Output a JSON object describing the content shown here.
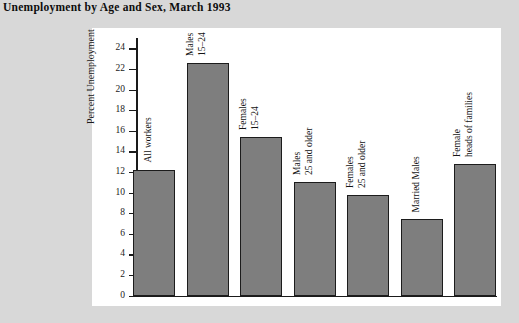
{
  "figure": {
    "title": "Unemployment by Age and Sex, March 1993",
    "panel_background": "#ffffff",
    "page_background": "#d8d8d8"
  },
  "chart_data": {
    "type": "bar",
    "title": "Unemployment by Age and Sex, March 1993",
    "xlabel": "",
    "ylabel": "Percent Unemployment",
    "ylim": [
      0,
      25
    ],
    "yticks": [
      0,
      2,
      4,
      6,
      8,
      10,
      12,
      14,
      16,
      18,
      20,
      22,
      24
    ],
    "grid": false,
    "legend": null,
    "bar_color": "#7e7e7e",
    "bar_edge_color": "#1c1c1c",
    "categories": [
      "All workers",
      "Males 15–24",
      "Females 15–24",
      "Males 25 and older",
      "Females 25 and older",
      "Married Males",
      "Female heads of families"
    ],
    "category_lines": [
      [
        "All workers"
      ],
      [
        "Males",
        "15–24"
      ],
      [
        "Females",
        "15–24"
      ],
      [
        "Males",
        "25 and older"
      ],
      [
        "Females",
        "25 and older"
      ],
      [
        "Married Males"
      ],
      [
        "Female",
        "heads of families"
      ]
    ],
    "values": [
      12.2,
      22.6,
      15.4,
      11.0,
      9.8,
      7.4,
      12.8
    ]
  }
}
